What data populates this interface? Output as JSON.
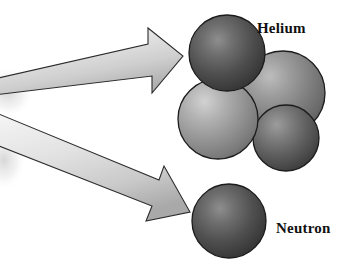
{
  "figure": {
    "type": "scientific-diagram",
    "background_color": "#ffffff",
    "width": 345,
    "height": 276
  },
  "labels": {
    "helium": "Helium",
    "neutron": "Neutron"
  },
  "colors": {
    "arrow_light": "#f2f2f2",
    "arrow_mid": "#d8d8d8",
    "arrow_dark": "#a8a8a8",
    "arrow_outline": "#2b2b2b",
    "sphere_dark_light": "#8c8c8c",
    "sphere_dark_base": "#4a4a4a",
    "sphere_dark_edge": "#2e2e2e",
    "sphere_mid_light": "#b4b4b4",
    "sphere_mid_base": "#757575",
    "sphere_mid_edge": "#4d4d4d",
    "sphere_light_light": "#c8c8c8",
    "sphere_light_base": "#8a8a8a",
    "sphere_light_edge": "#5a5a5a",
    "outline": "#1c1c1c",
    "text": "#111111",
    "smudge": "#d9d9d9"
  },
  "arrows": [
    {
      "name": "upper-arrow",
      "direction": "up-right",
      "points_to": "Helium",
      "tail_x": 0,
      "tail_y": 76,
      "tip_x": 182,
      "tip_y": 46
    },
    {
      "name": "lower-arrow",
      "direction": "down-right",
      "points_to": "Neutron",
      "tail_x": 0,
      "tail_y": 122,
      "tip_x": 190,
      "tip_y": 222
    }
  ],
  "particles": {
    "helium_cluster": {
      "label": "Helium",
      "sphere_count": 4,
      "spheres": [
        {
          "name": "sphere-top-left",
          "cx": 227,
          "cy": 53,
          "r": 38,
          "shade": "dark"
        },
        {
          "name": "sphere-right",
          "cx": 283,
          "cy": 93,
          "r": 42,
          "shade": "mid"
        },
        {
          "name": "sphere-bottom-left",
          "cx": 218,
          "cy": 119,
          "r": 40,
          "shade": "light"
        },
        {
          "name": "sphere-bottom-right",
          "cx": 286,
          "cy": 138,
          "r": 33,
          "shade": "dark-mid"
        }
      ]
    },
    "neutron": {
      "label": "Neutron",
      "sphere_count": 1,
      "spheres": [
        {
          "name": "sphere-neutron",
          "cx": 229,
          "cy": 221,
          "r": 37,
          "shade": "dark"
        }
      ]
    }
  }
}
